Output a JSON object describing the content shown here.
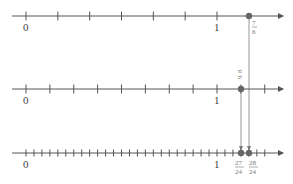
{
  "diagram": {
    "lines": [
      {
        "name": "sixths",
        "denominator": 6,
        "labels": [
          "0",
          "1"
        ],
        "point": {
          "numerator": 7,
          "denominator": 6,
          "label_num": "7",
          "label_den": "6"
        }
      },
      {
        "name": "eighths",
        "denominator": 8,
        "labels": [
          "0",
          "1"
        ],
        "point": {
          "numerator": 9,
          "denominator": 8,
          "label_num": "9",
          "label_den": "8"
        }
      },
      {
        "name": "twenty-fourths",
        "denominator": 24,
        "labels": [
          "0",
          "1"
        ],
        "points": [
          {
            "numerator": 27,
            "denominator": 24,
            "label_num": "27",
            "label_den": "24"
          },
          {
            "numerator": 28,
            "denominator": 24,
            "label_num": "28",
            "label_den": "24"
          }
        ]
      }
    ],
    "colors": {
      "axis": "#555555",
      "point": "#666666",
      "guide": "#999999"
    }
  }
}
